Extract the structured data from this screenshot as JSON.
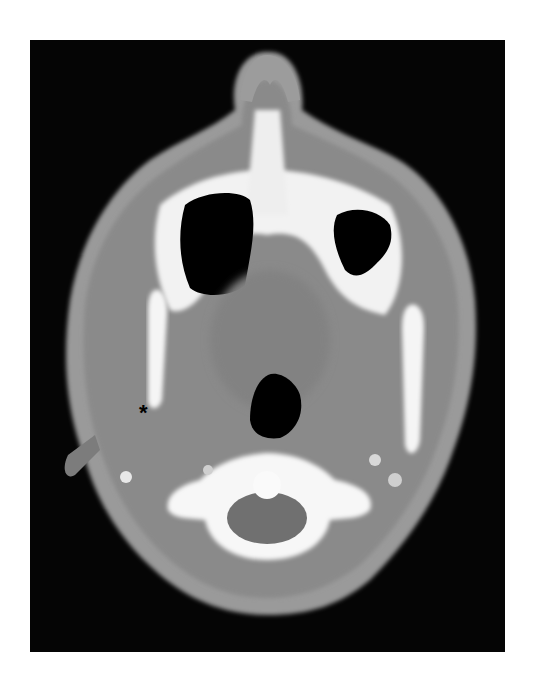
{
  "image": {
    "type": "axial CT scan",
    "annotation_marker": "*",
    "colors": {
      "background": "#050505",
      "soft_tissue": "#8c8c8c",
      "bone": "#f5f5f5",
      "air": "#000000",
      "page": "#ffffff"
    }
  }
}
